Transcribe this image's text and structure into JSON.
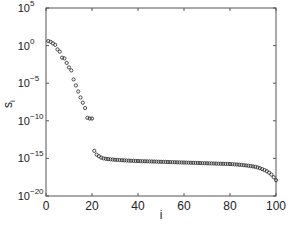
{
  "chart_data": {
    "type": "scatter",
    "title": "",
    "xlabel": "i",
    "ylabel": "s_i",
    "yscale": "log",
    "xlim": [
      0,
      100
    ],
    "ylim": [
      1e-20,
      100000.0
    ],
    "grid": false,
    "legend": null,
    "marker": "open-circle",
    "x_ticks": [
      0,
      20,
      40,
      60,
      80,
      100
    ],
    "y_ticks": [
      {
        "exp": 5,
        "label": "10",
        "sup": "5"
      },
      {
        "exp": 0,
        "label": "10",
        "sup": "0"
      },
      {
        "exp": -5,
        "label": "10",
        "sup": "−5"
      },
      {
        "exp": -10,
        "label": "10",
        "sup": "−10"
      },
      {
        "exp": -15,
        "label": "10",
        "sup": "−15"
      },
      {
        "exp": -20,
        "label": "10",
        "sup": "−20"
      }
    ],
    "series": [
      {
        "name": "s_i",
        "x": [
          1,
          2,
          3,
          4,
          5,
          6,
          7,
          8,
          9,
          10,
          11,
          12,
          13,
          14,
          15,
          16,
          17,
          18,
          19,
          20,
          21,
          22,
          23,
          24,
          25,
          26,
          27,
          28,
          29,
          30,
          31,
          32,
          33,
          34,
          35,
          36,
          37,
          38,
          39,
          40,
          41,
          42,
          43,
          44,
          45,
          46,
          47,
          48,
          49,
          50,
          51,
          52,
          53,
          54,
          55,
          56,
          57,
          58,
          59,
          60,
          61,
          62,
          63,
          64,
          65,
          66,
          67,
          68,
          69,
          70,
          71,
          72,
          73,
          74,
          75,
          76,
          77,
          78,
          79,
          80,
          81,
          82,
          83,
          84,
          85,
          86,
          87,
          88,
          89,
          90,
          91,
          92,
          93,
          94,
          95,
          96,
          97,
          98,
          99,
          100
        ],
        "log10_values": [
          0.6,
          0.5,
          0.3,
          0.1,
          -0.5,
          -0.8,
          -1.6,
          -1.7,
          -2.3,
          -2.9,
          -3.3,
          -4.5,
          -5.3,
          -6.1,
          -6.9,
          -7.6,
          -8.3,
          -9.6,
          -9.7,
          -9.7,
          -14.0,
          -14.5,
          -14.7,
          -14.9,
          -15.0,
          -15.05,
          -15.1,
          -15.12,
          -15.15,
          -15.18,
          -15.2,
          -15.22,
          -15.24,
          -15.26,
          -15.28,
          -15.3,
          -15.32,
          -15.33,
          -15.34,
          -15.35,
          -15.36,
          -15.37,
          -15.38,
          -15.39,
          -15.4,
          -15.41,
          -15.42,
          -15.43,
          -15.44,
          -15.45,
          -15.46,
          -15.47,
          -15.48,
          -15.49,
          -15.5,
          -15.51,
          -15.52,
          -15.53,
          -15.54,
          -15.55,
          -15.56,
          -15.57,
          -15.58,
          -15.59,
          -15.6,
          -15.61,
          -15.62,
          -15.63,
          -15.64,
          -15.65,
          -15.66,
          -15.67,
          -15.68,
          -15.69,
          -15.7,
          -15.71,
          -15.72,
          -15.73,
          -15.74,
          -15.75,
          -15.77,
          -15.79,
          -15.81,
          -15.84,
          -15.87,
          -15.9,
          -15.94,
          -15.98,
          -16.02,
          -16.07,
          -16.12,
          -16.2,
          -16.3,
          -16.42,
          -16.55,
          -16.7,
          -16.9,
          -17.15,
          -17.5,
          -17.9
        ]
      }
    ]
  }
}
